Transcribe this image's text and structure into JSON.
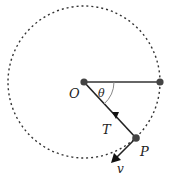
{
  "diagram": {
    "type": "circular-motion",
    "labels": {
      "center": "O",
      "angle": "θ",
      "tension": "T",
      "particle": "P",
      "velocity": "v"
    },
    "colors": {
      "stroke": "#333333",
      "dot": "#444444",
      "angle_arc": "#888888"
    }
  }
}
